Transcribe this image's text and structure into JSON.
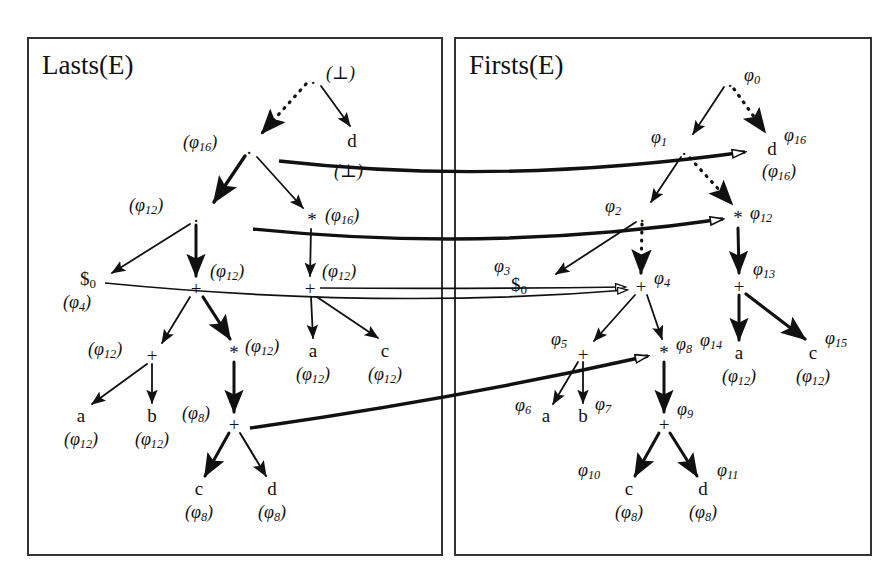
{
  "figure": {
    "type": "two-panel-expression-dag",
    "panels": [
      {
        "id": "lasts",
        "title": "Lasts(E)"
      },
      {
        "id": "firsts",
        "title": "Firsts(E)"
      }
    ]
  },
  "left_panel": {
    "title": "Lasts(E)",
    "nodes": [
      {
        "id": "L0",
        "symbol": ".",
        "annotation": "(⊥)",
        "x": 313,
        "y": 77
      },
      {
        "id": "L1",
        "symbol": ".",
        "annotation": "(φ16)",
        "x": 249,
        "y": 147
      },
      {
        "id": "L2",
        "symbol": "d",
        "annotation": "(⊥)",
        "x": 352,
        "y": 140
      },
      {
        "id": "L3",
        "symbol": ".",
        "annotation": "(φ12)",
        "x": 196,
        "y": 215
      },
      {
        "id": "L4",
        "symbol": "*",
        "annotation": "(φ16)",
        "x": 312,
        "y": 219
      },
      {
        "id": "L5",
        "symbol": "$0",
        "annotation": "(φ4)",
        "x": 88,
        "y": 280
      },
      {
        "id": "L6",
        "symbol": "+",
        "annotation": "(φ12)",
        "x": 196,
        "y": 288
      },
      {
        "id": "L7",
        "symbol": "+",
        "annotation": "(φ12)",
        "x": 310,
        "y": 288
      },
      {
        "id": "L8",
        "symbol": "+",
        "annotation": "(φ12)",
        "x": 152,
        "y": 355
      },
      {
        "id": "L9",
        "symbol": "*",
        "annotation": "(φ12)",
        "x": 234,
        "y": 352
      },
      {
        "id": "L10",
        "symbol": "a",
        "annotation": "(φ12)",
        "x": 313,
        "y": 350
      },
      {
        "id": "L11",
        "symbol": "c",
        "annotation": "(φ12)",
        "x": 385,
        "y": 350
      },
      {
        "id": "L12",
        "symbol": "a",
        "annotation": "(φ12)",
        "x": 81,
        "y": 415
      },
      {
        "id": "L13",
        "symbol": "b",
        "annotation": "(φ12)",
        "x": 152,
        "y": 415
      },
      {
        "id": "L14",
        "symbol": "+",
        "annotation": "(φ8)",
        "x": 234,
        "y": 424
      },
      {
        "id": "L15",
        "symbol": "c",
        "annotation": "(φ8)",
        "x": 199,
        "y": 488
      },
      {
        "id": "L16",
        "symbol": "d",
        "annotation": "(φ8)",
        "x": 272,
        "y": 488
      }
    ],
    "edges": [
      {
        "from": "L0",
        "to": "L1",
        "style": "dotted",
        "weight": "thin"
      },
      {
        "from": "L0",
        "to": "L2",
        "style": "solid",
        "weight": "thin"
      },
      {
        "from": "L1",
        "to": "L3",
        "style": "solid",
        "weight": "thick"
      },
      {
        "from": "L1",
        "to": "L4",
        "style": "solid",
        "weight": "thin"
      },
      {
        "from": "L3",
        "to": "L5",
        "style": "solid",
        "weight": "thin"
      },
      {
        "from": "L3",
        "to": "L6",
        "style": "solid",
        "weight": "thick"
      },
      {
        "from": "L4",
        "to": "L7",
        "style": "solid",
        "weight": "thin"
      },
      {
        "from": "L6",
        "to": "L8",
        "style": "solid",
        "weight": "thin"
      },
      {
        "from": "L6",
        "to": "L9",
        "style": "solid",
        "weight": "thick"
      },
      {
        "from": "L7",
        "to": "L10",
        "style": "solid",
        "weight": "thin"
      },
      {
        "from": "L7",
        "to": "L11",
        "style": "solid",
        "weight": "thin"
      },
      {
        "from": "L8",
        "to": "L12",
        "style": "solid",
        "weight": "thin"
      },
      {
        "from": "L8",
        "to": "L13",
        "style": "solid",
        "weight": "thin"
      },
      {
        "from": "L9",
        "to": "L14",
        "style": "solid",
        "weight": "thick"
      },
      {
        "from": "L14",
        "to": "L15",
        "style": "solid",
        "weight": "thick"
      },
      {
        "from": "L14",
        "to": "L16",
        "style": "solid",
        "weight": "thin"
      }
    ]
  },
  "right_panel": {
    "title": "Firsts(E)",
    "nodes": [
      {
        "id": "R0",
        "symbol": ".",
        "label": "φ0",
        "x": 730,
        "y": 80,
        "annotation": ""
      },
      {
        "id": "R1",
        "symbol": ".",
        "label": "φ1",
        "x": 684,
        "y": 148,
        "annotation": ""
      },
      {
        "id": "R2",
        "symbol": "d",
        "label": "φ16",
        "x": 772,
        "y": 148,
        "annotation": "(φ16)"
      },
      {
        "id": "R3",
        "symbol": ".",
        "label": "φ2",
        "x": 642,
        "y": 215,
        "annotation": ""
      },
      {
        "id": "R4",
        "symbol": "*",
        "label": "φ12",
        "x": 738,
        "y": 217,
        "annotation": ""
      },
      {
        "id": "R5",
        "symbol": "$0",
        "label": "φ3",
        "x": 519,
        "y": 286,
        "annotation": ""
      },
      {
        "id": "R6",
        "symbol": "+",
        "label": "φ4",
        "x": 641,
        "y": 286,
        "annotation": ""
      },
      {
        "id": "R7",
        "symbol": "+",
        "label": "φ13",
        "x": 739,
        "y": 286,
        "annotation": ""
      },
      {
        "id": "R8",
        "symbol": "+",
        "label": "φ5",
        "x": 583,
        "y": 354,
        "annotation": ""
      },
      {
        "id": "R9",
        "symbol": "*",
        "label": "φ8",
        "x": 664,
        "y": 352,
        "annotation": ""
      },
      {
        "id": "R10",
        "symbol": "a",
        "label": "φ14",
        "x": 739,
        "y": 352,
        "annotation": "(φ12)"
      },
      {
        "id": "R11",
        "symbol": "c",
        "label": "φ15",
        "x": 813,
        "y": 352,
        "annotation": "(φ12)"
      },
      {
        "id": "R12",
        "symbol": "a",
        "label": "φ6",
        "x": 546,
        "y": 415,
        "annotation": ""
      },
      {
        "id": "R13",
        "symbol": "b",
        "label": "φ7",
        "x": 583,
        "y": 415,
        "annotation": ""
      },
      {
        "id": "R14",
        "symbol": "+",
        "label": "φ9",
        "x": 664,
        "y": 424,
        "annotation": ""
      },
      {
        "id": "R15",
        "symbol": "c",
        "label": "φ10",
        "x": 629,
        "y": 488,
        "annotation": "(φ8)"
      },
      {
        "id": "R16",
        "symbol": "d",
        "label": "φ11",
        "x": 703,
        "y": 488,
        "annotation": "(φ8)"
      }
    ],
    "edges": [
      {
        "from": "R0",
        "to": "R1",
        "style": "solid",
        "weight": "thin"
      },
      {
        "from": "R0",
        "to": "R2",
        "style": "dotted",
        "weight": "thin"
      },
      {
        "from": "R1",
        "to": "R3",
        "style": "solid",
        "weight": "thin"
      },
      {
        "from": "R1",
        "to": "R4",
        "style": "dotted",
        "weight": "thin"
      },
      {
        "from": "R3",
        "to": "R5",
        "style": "solid",
        "weight": "thin"
      },
      {
        "from": "R3",
        "to": "R6",
        "style": "dotted",
        "weight": "thin"
      },
      {
        "from": "R4",
        "to": "R7",
        "style": "solid",
        "weight": "thick"
      },
      {
        "from": "R6",
        "to": "R8",
        "style": "solid",
        "weight": "thin"
      },
      {
        "from": "R6",
        "to": "R9",
        "style": "solid",
        "weight": "thin"
      },
      {
        "from": "R7",
        "to": "R10",
        "style": "solid",
        "weight": "thick"
      },
      {
        "from": "R7",
        "to": "R11",
        "style": "solid",
        "weight": "thick"
      },
      {
        "from": "R8",
        "to": "R12",
        "style": "solid",
        "weight": "thin"
      },
      {
        "from": "R8",
        "to": "R13",
        "style": "solid",
        "weight": "thin"
      },
      {
        "from": "R9",
        "to": "R14",
        "style": "solid",
        "weight": "thick"
      },
      {
        "from": "R14",
        "to": "R15",
        "style": "solid",
        "weight": "thick"
      },
      {
        "from": "R14",
        "to": "R16",
        "style": "solid",
        "weight": "thick"
      }
    ]
  },
  "cross_links": [
    {
      "id": "X1",
      "from": "L2",
      "to": "R2",
      "weight": "thick",
      "arrow": "hollow",
      "note": "d(⊥) to d φ16"
    },
    {
      "id": "X2",
      "from": "L4",
      "to": "R4",
      "weight": "thick",
      "arrow": "hollow",
      "note": "*(φ16) to * φ12"
    },
    {
      "id": "X3",
      "from": "L7",
      "to": "R6",
      "weight": "thin",
      "arrow": "hollow",
      "note": "+(φ12) to + φ4"
    },
    {
      "id": "X4",
      "from": "L5",
      "to": "R6",
      "weight": "thin",
      "arrow": "hollow",
      "note": "$0(φ4) to + φ4"
    },
    {
      "id": "X5",
      "from": "L14",
      "to": "R9",
      "weight": "thick",
      "arrow": "hollow",
      "note": "+(φ8) to * φ8"
    }
  ],
  "symbols": {
    "bottom": "⊥",
    "phi": "φ",
    "dollar_zero": "$0",
    "concat": ".",
    "star": "*",
    "plus": "+"
  },
  "colors": {
    "ink": "#111111",
    "frame": "#333333",
    "background": "#ffffff"
  }
}
